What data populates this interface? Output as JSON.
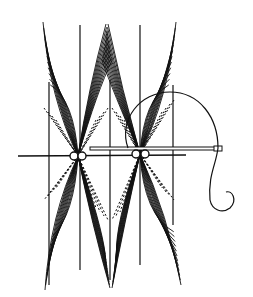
{
  "diagram": {
    "type": "line-art illustration",
    "background_color": "#ffffff",
    "ink_color": "#111111",
    "vertical_guides_x": [
      48,
      80,
      110,
      140,
      173
    ],
    "nodes": [
      {
        "x": 77,
        "y": 155
      },
      {
        "x": 140,
        "y": 153
      }
    ],
    "horizontal_line": {
      "x1": 18,
      "x2": 185,
      "y": 156
    },
    "needle": {
      "x1": 90,
      "x2": 222,
      "y": 149
    },
    "thread": "arc from needle eye looping over right node and trailing down with a curl"
  }
}
